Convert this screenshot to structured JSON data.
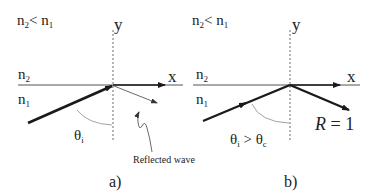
{
  "panels": [
    {
      "id": "a",
      "caption": "a)",
      "condition": {
        "left": "n",
        "left_sub": "2",
        "op": "<",
        "right": "n",
        "right_sub": "1"
      },
      "axis_y_label": "y",
      "axis_x_label": "x",
      "medium_top": {
        "base": "n",
        "sub": "2"
      },
      "medium_bottom": {
        "base": "n",
        "sub": "1"
      },
      "angle_label": {
        "base": "θ",
        "sub": "i"
      },
      "annotation": "Reflected wave"
    },
    {
      "id": "b",
      "caption": "b)",
      "condition": {
        "left": "n",
        "left_sub": "2",
        "op": "<",
        "right": "n",
        "right_sub": "1"
      },
      "axis_y_label": "y",
      "axis_x_label": "x",
      "medium_top": {
        "base": "n",
        "sub": "2"
      },
      "medium_bottom": {
        "base": "n",
        "sub": "1"
      },
      "angle_label": {
        "base": "θ",
        "sub": "i",
        "op": ">",
        "base2": "θ",
        "sub2": "c"
      },
      "annotation": "R = 1"
    }
  ],
  "colors": {
    "line": "#1a1a1a",
    "thin": "#444444",
    "arc": "#999999"
  }
}
